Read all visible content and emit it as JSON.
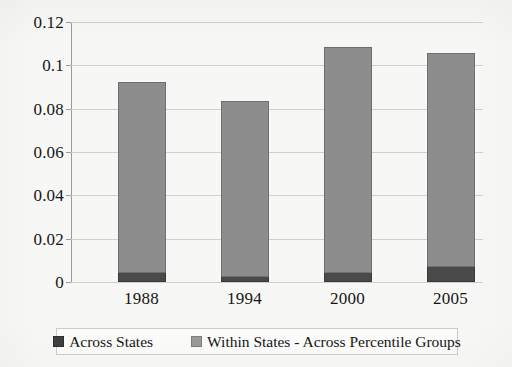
{
  "chart_data": {
    "type": "bar",
    "subtype": "stacked-column",
    "title": "",
    "xlabel": "",
    "ylabel": "",
    "categories": [
      "1988",
      "1994",
      "2000",
      "2005"
    ],
    "series": [
      {
        "name": "Across States",
        "color": "#4a4a4a",
        "values": [
          0.004,
          0.0025,
          0.004,
          0.007
        ]
      },
      {
        "name": "Within States - Across Percentile Groups",
        "color": "#8d8d8d",
        "values": [
          0.0885,
          0.081,
          0.1045,
          0.0985
        ]
      }
    ],
    "totals": [
      0.0925,
      0.0835,
      0.1085,
      0.1055
    ],
    "ylim": [
      0,
      0.12
    ],
    "ytick_values": [
      0,
      0.02,
      0.04,
      0.06,
      0.08,
      0.1,
      0.12
    ],
    "ytick_labels": [
      "0",
      "0.02",
      "0.04",
      "0.06",
      "0.08",
      "0.1",
      "0.12"
    ],
    "grid": true,
    "legend_position": "bottom"
  },
  "legend": {
    "entries": [
      {
        "label": "Across States",
        "swatch": "across-states-swatch"
      },
      {
        "label": "Within States - Across Percentile Groups",
        "swatch": "within-states-swatch"
      }
    ]
  }
}
